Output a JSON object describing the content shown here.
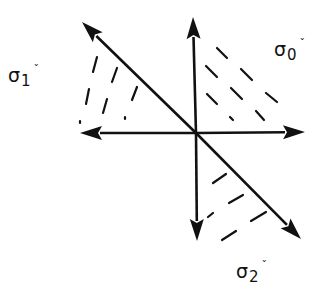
{
  "diagram": {
    "colors": {
      "ink": "#111111",
      "background": "#ffffff"
    },
    "labels": [
      {
        "id": "sigma1",
        "symbol": "σ",
        "subscript": "1",
        "mark": "ˇ",
        "x": 8,
        "y": 66
      },
      {
        "id": "sigma0",
        "symbol": "σ",
        "subscript": "0",
        "mark": "ˇ",
        "x": 274,
        "y": 40
      },
      {
        "id": "sigma2",
        "symbol": "σ",
        "subscript": "2",
        "mark": "ˇ",
        "x": 236,
        "y": 262
      }
    ],
    "origin": {
      "x": 196,
      "y": 133
    },
    "arrows": [
      {
        "id": "axis-up",
        "tip": [
          193,
          17
        ]
      },
      {
        "id": "axis-down",
        "tip": [
          197,
          241
        ]
      },
      {
        "id": "axis-left",
        "tip": [
          80,
          133
        ]
      },
      {
        "id": "axis-right",
        "tip": [
          305,
          132
        ]
      },
      {
        "id": "diagonal-up-left",
        "tip": [
          82,
          22
        ]
      },
      {
        "id": "diagonal-down-right",
        "tip": [
          301,
          239
        ]
      }
    ],
    "hatch_regions": [
      {
        "id": "sigma1-cone",
        "dashes": [
          [
            97,
            57,
            93,
            72
          ],
          [
            117,
            68,
            112,
            82
          ],
          [
            89,
            89,
            86,
            104
          ],
          [
            107,
            99,
            103,
            113
          ],
          [
            137,
            87,
            132,
            100
          ],
          [
            125,
            117,
            125,
            119
          ],
          [
            80,
            121,
            80,
            123
          ]
        ]
      },
      {
        "id": "sigma0-cone",
        "dashes": [
          [
            217,
            48,
            227,
            58
          ],
          [
            206,
            66,
            217,
            77
          ],
          [
            241,
            69,
            252,
            80
          ],
          [
            207,
            94,
            217,
            104
          ],
          [
            231,
            88,
            242,
            99
          ],
          [
            266,
            93,
            277,
            102
          ],
          [
            230,
            117,
            233,
            120
          ],
          [
            256,
            111,
            264,
            120
          ]
        ]
      },
      {
        "id": "sigma2-cone",
        "dashes": [
          [
            213,
            183,
            226,
            174
          ],
          [
            229,
            203,
            243,
            195
          ],
          [
            208,
            217,
            213,
            213
          ],
          [
            251,
            221,
            266,
            212
          ],
          [
            222,
            240,
            236,
            231
          ]
        ]
      }
    ]
  }
}
